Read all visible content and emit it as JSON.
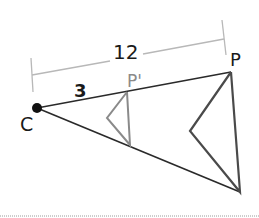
{
  "diagram": {
    "labels": {
      "center": "C",
      "image_point": "P'",
      "original_point": "P",
      "short_distance": "3",
      "long_distance": "12"
    },
    "colors": {
      "main_line": "#2a2a2a",
      "image_triangle": "#8a8a8a",
      "original_triangle": "#4a4a4a",
      "dimension_line": "#b8b8b8",
      "image_label": "#8a8a8a",
      "divider": "#9a9a9a"
    },
    "scale_factor_relation": "CP' = 3, CP = 12"
  }
}
